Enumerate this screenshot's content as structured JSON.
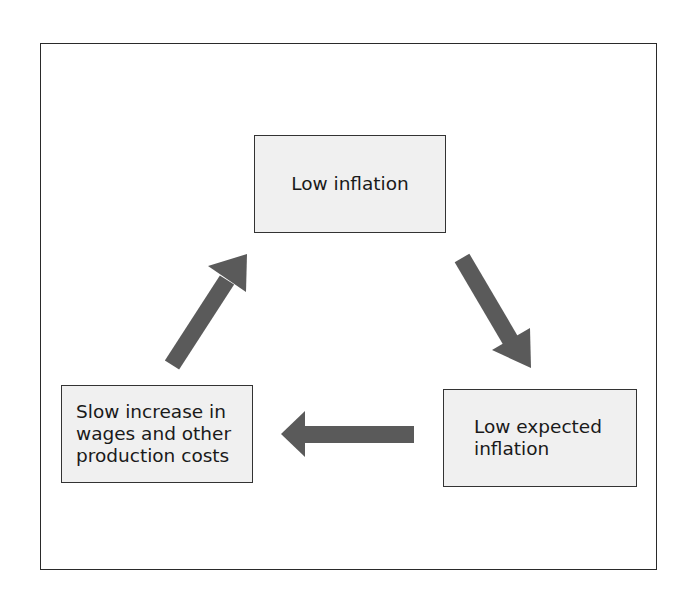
{
  "diagram": {
    "type": "cycle",
    "nodes": [
      {
        "id": "top",
        "label": "Low inflation"
      },
      {
        "id": "right",
        "label": "Low expected\ninflation"
      },
      {
        "id": "left",
        "label": "Slow increase in\nwages and other\nproduction costs"
      }
    ],
    "edges": [
      {
        "from": "top",
        "to": "right",
        "direction": "down-right"
      },
      {
        "from": "right",
        "to": "left",
        "direction": "left"
      },
      {
        "from": "left",
        "to": "top",
        "direction": "up-right"
      }
    ],
    "colors": {
      "node_fill": "#f0f0f0",
      "node_border": "#333333",
      "arrow": "#5a5a5a",
      "frame": "#2a2a2a"
    }
  }
}
